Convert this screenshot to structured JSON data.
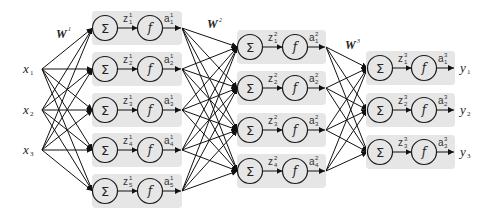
{
  "diagram": {
    "title": "",
    "sum_symbol": "Σ",
    "activation_symbol": "f",
    "layer_sizes": [
      3,
      5,
      4,
      3
    ],
    "colors": {
      "box": "#e6e6e6",
      "stroke": "#111111",
      "background": "#ffffff"
    },
    "weights": [
      {
        "base": "W",
        "sup": "1"
      },
      {
        "base": "W",
        "sup": "2"
      },
      {
        "base": "W",
        "sup": "3"
      }
    ],
    "inputs": [
      {
        "base": "x",
        "sub": "1"
      },
      {
        "base": "x",
        "sub": "2"
      },
      {
        "base": "x",
        "sub": "3"
      }
    ],
    "outputs": [
      {
        "base": "y",
        "sub": "1"
      },
      {
        "base": "y",
        "sub": "2"
      },
      {
        "base": "y",
        "sub": "3"
      }
    ],
    "layers": [
      {
        "nodes": [
          {
            "z": {
              "base": "z",
              "sup": "1",
              "sub": "1"
            },
            "a": {
              "base": "a",
              "sup": "1",
              "sub": "1"
            }
          },
          {
            "z": {
              "base": "z",
              "sup": "1",
              "sub": "2"
            },
            "a": {
              "base": "a",
              "sup": "1",
              "sub": "2"
            }
          },
          {
            "z": {
              "base": "z",
              "sup": "1",
              "sub": "3"
            },
            "a": {
              "base": "a",
              "sup": "1",
              "sub": "3"
            }
          },
          {
            "z": {
              "base": "z",
              "sup": "1",
              "sub": "4"
            },
            "a": {
              "base": "a",
              "sup": "1",
              "sub": "4"
            }
          },
          {
            "z": {
              "base": "z",
              "sup": "1",
              "sub": "5"
            },
            "a": {
              "base": "a",
              "sup": "1",
              "sub": "5"
            }
          }
        ]
      },
      {
        "nodes": [
          {
            "z": {
              "base": "z",
              "sup": "2",
              "sub": "1"
            },
            "a": {
              "base": "a",
              "sup": "2",
              "sub": "1"
            }
          },
          {
            "z": {
              "base": "z",
              "sup": "2",
              "sub": "2"
            },
            "a": {
              "base": "a",
              "sup": "2",
              "sub": "2"
            }
          },
          {
            "z": {
              "base": "z",
              "sup": "2",
              "sub": "3"
            },
            "a": {
              "base": "a",
              "sup": "2",
              "sub": "3"
            }
          },
          {
            "z": {
              "base": "z",
              "sup": "2",
              "sub": "4"
            },
            "a": {
              "base": "a",
              "sup": "2",
              "sub": "4"
            }
          }
        ]
      },
      {
        "nodes": [
          {
            "z": {
              "base": "z",
              "sup": "3",
              "sub": "1"
            },
            "a": {
              "base": "a",
              "sup": "3",
              "sub": "1"
            }
          },
          {
            "z": {
              "base": "z",
              "sup": "3",
              "sub": "2"
            },
            "a": {
              "base": "a",
              "sup": "3",
              "sub": "2"
            }
          },
          {
            "z": {
              "base": "z",
              "sup": "3",
              "sub": "3"
            },
            "a": {
              "base": "a",
              "sup": "3",
              "sub": "3"
            }
          }
        ]
      }
    ]
  }
}
